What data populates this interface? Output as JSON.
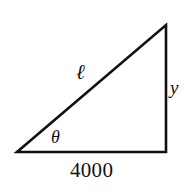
{
  "figure": {
    "type": "right-triangle-diagram",
    "background_color": "#ffffff",
    "stroke_color": "#111111",
    "stroke_width": 2.6
  },
  "geometry": {
    "vertices": {
      "bottom_left": {
        "x": 17,
        "y": 152
      },
      "bottom_right": {
        "x": 166,
        "y": 152
      },
      "top_right": {
        "x": 166,
        "y": 25
      }
    },
    "edges": [
      {
        "name": "base",
        "from": "bottom_left",
        "to": "bottom_right"
      },
      {
        "name": "vertical-leg",
        "from": "bottom_right",
        "to": "top_right"
      },
      {
        "name": "hypotenuse",
        "from": "top_right",
        "to": "bottom_left"
      }
    ]
  },
  "labels": {
    "hypotenuse": "ℓ",
    "angle": "θ",
    "vertical_leg": "y",
    "base": "4000"
  }
}
